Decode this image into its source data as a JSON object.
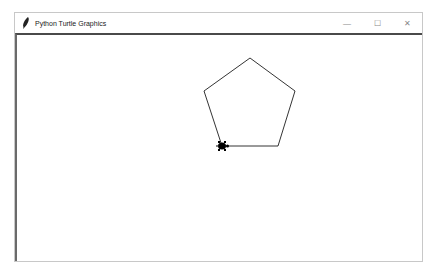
{
  "window": {
    "title": "Python Turtle Graphics",
    "app_icon": "feather-icon",
    "controls": {
      "minimize": "—",
      "maximize": "☐",
      "close": "✕"
    }
  },
  "canvas": {
    "background": "#ffffff",
    "shape": "pentagon",
    "stroke_color": "#000000",
    "vertices": [
      [
        250,
        58
      ],
      [
        295,
        91
      ],
      [
        278,
        146
      ],
      [
        222,
        146
      ],
      [
        204,
        91
      ]
    ],
    "turtle": {
      "x": 222,
      "y": 146,
      "heading": "east",
      "color": "#000000"
    }
  }
}
